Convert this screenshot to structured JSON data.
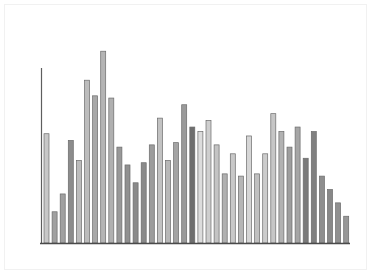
{
  "figure": {
    "background_color": "#ffffff",
    "frame_color": "#f1f1f1",
    "axis_color": "#4a4a4a"
  },
  "chart_data": {
    "type": "bar",
    "title": "",
    "subtitle": "",
    "xlabel": "",
    "ylabel": "",
    "grid": false,
    "legend": false,
    "legend_position": "none",
    "xlim": [
      0,
      38
    ],
    "ylim": [
      0,
      100
    ],
    "axis_ticks": {
      "x": [],
      "y": []
    },
    "tick_labels": {
      "x": [],
      "y": []
    },
    "annotations": [],
    "categories": [
      "1",
      "2",
      "3",
      "4",
      "5",
      "6",
      "7",
      "8",
      "9",
      "10",
      "11",
      "12",
      "13",
      "14",
      "15",
      "16",
      "17",
      "18",
      "19",
      "20",
      "21",
      "22",
      "23",
      "24",
      "25",
      "26",
      "27",
      "28",
      "29",
      "30",
      "31",
      "32",
      "33",
      "34",
      "35",
      "36",
      "37",
      "38"
    ],
    "values": [
      49,
      14,
      22,
      46,
      37,
      73,
      66,
      86,
      65,
      43,
      35,
      27,
      36,
      44,
      56,
      37,
      45,
      62,
      52,
      50,
      55,
      44,
      31,
      40,
      30,
      48,
      31,
      40,
      58,
      50,
      43,
      52,
      38,
      50,
      30,
      24,
      18,
      12
    ],
    "bar_colors": [
      "#c8c8c8",
      "#a0a0a0",
      "#a0a0a0",
      "#8c8c8c",
      "#bcbcbc",
      "#bcbcbc",
      "#a8a8a8",
      "#b4b4b4",
      "#b0b0b0",
      "#989898",
      "#909090",
      "#8a8a8a",
      "#8a8a8a",
      "#9c9c9c",
      "#c2c2c2",
      "#b8b8b8",
      "#a4a4a4",
      "#9a9a9a",
      "#6e6e6e",
      "#dcdcdc",
      "#cecece",
      "#c4c4c4",
      "#b0b0b0",
      "#c8c8c8",
      "#b6b6b6",
      "#d6d6d6",
      "#c0c0c0",
      "#cccccc",
      "#c6c6c6",
      "#b2b2b2",
      "#9e9e9e",
      "#a6a6a6",
      "#7a7a7a",
      "#808080",
      "#8e8e8e",
      "#888888",
      "#909090",
      "#989898"
    ],
    "bar_edge_color": "#6b6b6b",
    "bar_width_px": 5,
    "bar_pitch_px": 8.1,
    "baseline_y_px": 243,
    "plot_left_px": 44,
    "plot_top_px": 20,
    "y_axis_line_height_px": 175
  }
}
